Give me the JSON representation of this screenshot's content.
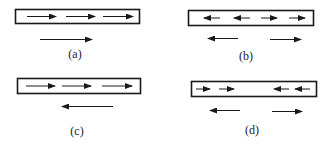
{
  "panels": [
    {
      "id": "a",
      "label": "(a)",
      "box": {
        "x": 15,
        "y": 9,
        "w": 124,
        "h": 14
      },
      "inner_arrows": [
        {
          "x1": 27,
          "x2": 56,
          "dir": "right"
        },
        {
          "x1": 66,
          "x2": 95,
          "dir": "right"
        },
        {
          "x1": 103,
          "x2": 133,
          "dir": "right"
        }
      ],
      "outer_arrows": [
        {
          "x1": 40,
          "x2": 92,
          "y": 39,
          "dir": "right"
        }
      ],
      "label_pos": {
        "x": 75,
        "y": 47
      }
    },
    {
      "id": "b",
      "label": "(b)",
      "box": {
        "x": 188,
        "y": 10,
        "w": 125,
        "h": 15
      },
      "inner_arrows": [
        {
          "x1": 204,
          "x2": 220,
          "dir": "left"
        },
        {
          "x1": 234,
          "x2": 250,
          "dir": "left"
        },
        {
          "x1": 261,
          "x2": 277,
          "dir": "right"
        },
        {
          "x1": 289,
          "x2": 305,
          "dir": "right"
        }
      ],
      "outer_arrows": [
        {
          "x1": 208,
          "x2": 238,
          "y": 38,
          "dir": "left"
        },
        {
          "x1": 270,
          "x2": 301,
          "y": 39,
          "dir": "right"
        }
      ],
      "label_pos": {
        "x": 246,
        "y": 49
      }
    },
    {
      "id": "c",
      "label": "(c)",
      "box": {
        "x": 17,
        "y": 78,
        "w": 123,
        "h": 15
      },
      "inner_arrows": [
        {
          "x1": 26,
          "x2": 55,
          "dir": "right"
        },
        {
          "x1": 62,
          "x2": 91,
          "dir": "right"
        },
        {
          "x1": 102,
          "x2": 132,
          "dir": "right"
        }
      ],
      "outer_arrows": [
        {
          "x1": 62,
          "x2": 113,
          "y": 106,
          "dir": "left"
        }
      ],
      "label_pos": {
        "x": 77,
        "y": 124
      }
    },
    {
      "id": "d",
      "label": "(d)",
      "box": {
        "x": 191,
        "y": 81,
        "w": 125,
        "h": 15
      },
      "inner_arrows": [
        {
          "x1": 196,
          "x2": 210,
          "dir": "right"
        },
        {
          "x1": 219,
          "x2": 234,
          "dir": "right"
        },
        {
          "x1": 274,
          "x2": 289,
          "dir": "left"
        },
        {
          "x1": 295,
          "x2": 310,
          "dir": "left"
        }
      ],
      "outer_arrows": [
        {
          "x1": 210,
          "x2": 240,
          "y": 110,
          "dir": "left"
        },
        {
          "x1": 272,
          "x2": 302,
          "y": 111,
          "dir": "right"
        }
      ],
      "label_pos": {
        "x": 252,
        "y": 123
      }
    }
  ],
  "colors": {
    "stroke": "#1a1a1a",
    "background": "#ffffff"
  }
}
